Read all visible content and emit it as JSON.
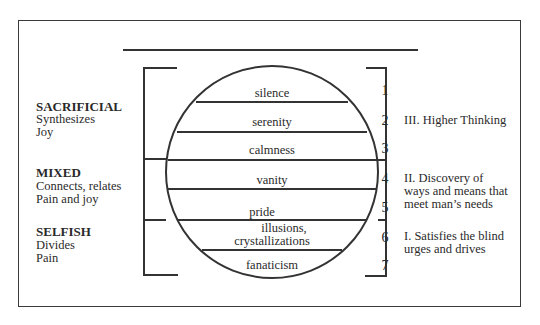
{
  "categories": [
    {
      "title": "SACRIFICIAL",
      "lines": [
        "Synthesizes",
        "Joy"
      ]
    },
    {
      "title": "MIXED",
      "lines": [
        "Connects, relates",
        "Pain and joy"
      ]
    },
    {
      "title": "SELFISH",
      "lines": [
        "Divides",
        "Pain"
      ]
    }
  ],
  "layers": [
    {
      "label": "silence",
      "number": "1"
    },
    {
      "label": "serenity",
      "number": "2"
    },
    {
      "label": "calmness",
      "number": "3"
    },
    {
      "label": "vanity",
      "number": "4"
    },
    {
      "label": "pride",
      "number": "5"
    },
    {
      "label_line1": "illusions,",
      "label_line2": "crystallizations",
      "number": "6"
    },
    {
      "label": "fanaticism",
      "number": "7"
    }
  ],
  "stages": [
    {
      "lines": [
        "III.  Higher Thinking"
      ]
    },
    {
      "lines": [
        "II.  Discovery of",
        "ways and means that",
        "meet man’s needs"
      ]
    },
    {
      "lines": [
        "I.  Satisfies the blind",
        "urges and drives"
      ]
    }
  ],
  "colors": {
    "line": "#333333",
    "text": "#2a2a2a",
    "background": "#ffffff"
  }
}
